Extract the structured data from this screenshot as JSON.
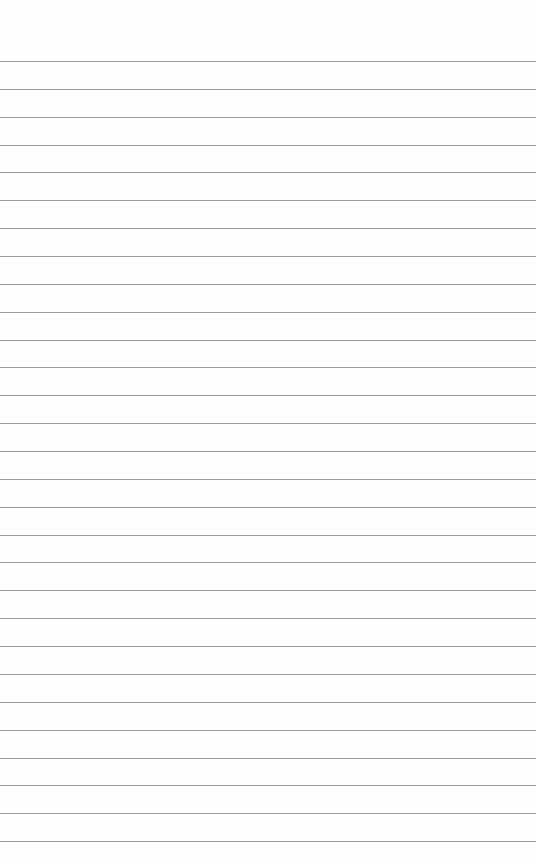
{
  "page": {
    "type": "lined paper",
    "background_color": "#fefefe",
    "line_color": "#8a8a8a",
    "line_count": 29,
    "first_line_y": 61,
    "line_spacing": 27.86
  }
}
